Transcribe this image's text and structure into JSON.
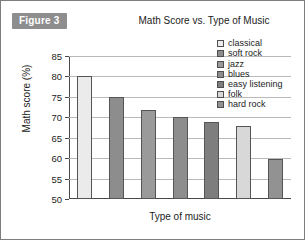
{
  "figure": {
    "badge_label": "Figure 3",
    "badge_bg": "#8e8e8e",
    "badge_text_color": "#ffffff",
    "border_color": "#7d7d7d"
  },
  "chart_data": {
    "type": "bar",
    "title": "Math Score vs. Type of Music",
    "xlabel": "Type of music",
    "ylabel": "Math score (%)",
    "ylim": [
      50,
      85
    ],
    "ytick_labels": [
      "85",
      "80",
      "75",
      "70",
      "65",
      "60",
      "55",
      "50"
    ],
    "ytick_values": [
      85,
      80,
      75,
      70,
      65,
      60,
      55,
      50
    ],
    "grid": true,
    "grid_axis": "y",
    "grid_color": "#b9b9b9",
    "axis_color": "#4a4a4a",
    "legend_position": "top-right",
    "categories": [
      "classical",
      "soft rock",
      "jazz",
      "blues",
      "easy listening",
      "folk",
      "hard rock"
    ],
    "values": [
      80.1,
      75.0,
      71.7,
      70.0,
      68.8,
      67.8,
      59.8
    ],
    "bar_colors": [
      "#ebebeb",
      "#8d8d8d",
      "#9a9a9a",
      "#8d8d8d",
      "#7e7e7e",
      "#d8d8d8",
      "#929292"
    ],
    "bar_edge_color": "#555555",
    "xtick_labels_shown": false,
    "series": [
      {
        "name": "Math score (%)",
        "points": [
          {
            "category": "classical",
            "value": 80.1,
            "color": "#ebebeb"
          },
          {
            "category": "soft rock",
            "value": 75.0,
            "color": "#8d8d8d"
          },
          {
            "category": "jazz",
            "value": 71.7,
            "color": "#9a9a9a"
          },
          {
            "category": "blues",
            "value": 70.0,
            "color": "#8d8d8d"
          },
          {
            "category": "easy listening",
            "value": 68.8,
            "color": "#7e7e7e"
          },
          {
            "category": "folk",
            "value": 67.8,
            "color": "#d8d8d8"
          },
          {
            "category": "hard rock",
            "value": 59.8,
            "color": "#929292"
          }
        ]
      }
    ]
  }
}
